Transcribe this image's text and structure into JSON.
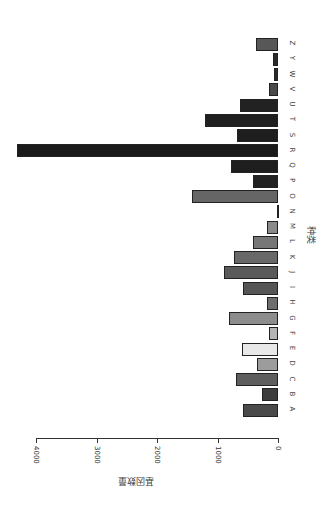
{
  "chart_data": {
    "type": "bar",
    "orientation": "rotated 90deg clockwise",
    "title": "",
    "xlabel": "种类",
    "ylabel": "基因数量",
    "ylim": [
      0,
      4000
    ],
    "yticks": [
      0,
      1000,
      2000,
      3000,
      4000
    ],
    "grid": false,
    "categories": [
      "A",
      "B",
      "C",
      "D",
      "E",
      "F",
      "G",
      "H",
      "I",
      "J",
      "K",
      "L",
      "M",
      "N",
      "O",
      "P",
      "Q",
      "R",
      "S",
      "T",
      "U",
      "V",
      "W",
      "Y",
      "Z"
    ],
    "values": [
      580,
      265,
      695,
      345,
      595,
      150,
      810,
      180,
      580,
      890,
      725,
      410,
      180,
      10,
      1420,
      410,
      780,
      4315,
      680,
      1205,
      630,
      150,
      60,
      85,
      365
    ],
    "colors": [
      "#4a4a4a",
      "#3d3d3d",
      "#5e5e5e",
      "#9c9c9c",
      "#e8e8e8",
      "#b4b4b4",
      "#8c8c8c",
      "#6e6e6e",
      "#555555",
      "#5a5a5a",
      "#686868",
      "#777777",
      "#8a8a8a",
      "#333333",
      "#666666",
      "#222222",
      "#1e1e1e",
      "#1a1a1a",
      "#1e1e1e",
      "#202020",
      "#222222",
      "#4a4a4a",
      "#2a2a2a",
      "#2a2a2a",
      "#575757"
    ]
  },
  "labels": {
    "xlabel": "种类",
    "ylabel": "基因数量",
    "ticks": [
      "0",
      "1000",
      "2000",
      "3000",
      "4000"
    ]
  }
}
